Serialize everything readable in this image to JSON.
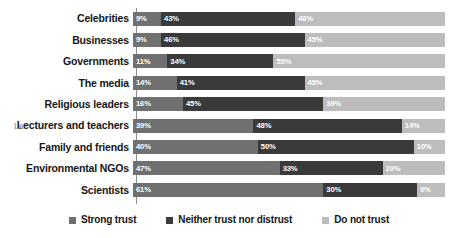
{
  "chart_data": {
    "type": "bar",
    "orientation": "horizontal",
    "stacked": true,
    "title": "",
    "subtitle": "",
    "xlabel": "",
    "ylabel": "",
    "xlim": [
      0,
      100
    ],
    "grid": false,
    "legend_position": "bottom",
    "categories": [
      "Celebrities",
      "Businesses",
      "Governments",
      "The media",
      "Religious leaders",
      "Lecturers and teachers",
      "Family and friends",
      "Environmental NGOs",
      "Scientists"
    ],
    "series": [
      {
        "name": "Strong trust",
        "color": "#707070",
        "values": [
          9,
          9,
          11,
          14,
          16,
          39,
          40,
          47,
          61
        ]
      },
      {
        "name": "Neither trust nor distrust",
        "color": "#3a3a3a",
        "values": [
          43,
          46,
          34,
          41,
          45,
          48,
          50,
          33,
          30
        ]
      },
      {
        "name": "Do not trust",
        "color": "#bdbdbd",
        "values": [
          48,
          45,
          55,
          45,
          39,
          14,
          10,
          20,
          9
        ]
      }
    ],
    "value_labels": [
      [
        "9%",
        "43%",
        "48%"
      ],
      [
        "9%",
        "46%",
        "45%"
      ],
      [
        "11%",
        "34%",
        "55%"
      ],
      [
        "14%",
        "41%",
        "45%"
      ],
      [
        "16%",
        "45%",
        "39%"
      ],
      [
        "39%",
        "48%",
        "14%"
      ],
      [
        "40%",
        "50%",
        "10%"
      ],
      [
        "47%",
        "33%",
        "20%"
      ],
      [
        "61%",
        "30%",
        "9%"
      ]
    ]
  },
  "legend": {
    "items": [
      {
        "label": "Strong trust",
        "swatch": "s0"
      },
      {
        "label": "Neither trust nor distrust",
        "swatch": "s1"
      },
      {
        "label": "Do not trust",
        "swatch": "s2"
      }
    ]
  },
  "artifacts": {
    "ghost_prefix_row": 5,
    "ghost_prefix_text": "Le"
  },
  "colors": {
    "strong_trust": "#707070",
    "neither": "#3a3a3a",
    "do_not_trust": "#bdbdbd",
    "axis": "#8d8d8d",
    "text": "#161616",
    "background": "#ffffff"
  }
}
